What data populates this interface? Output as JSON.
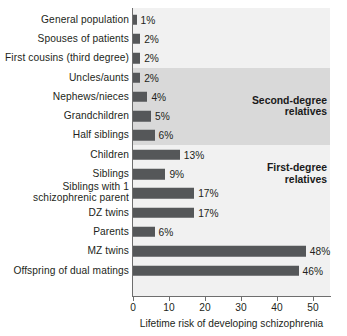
{
  "chart_data": {
    "type": "bar",
    "orientation": "horizontal",
    "title": "",
    "xlabel": "Lifetime risk of developing schizophrenia",
    "ylabel": "",
    "xlim": [
      0,
      55
    ],
    "xticks": [
      0,
      10,
      20,
      30,
      40,
      50
    ],
    "xtick_labels": [
      "0",
      "10",
      "20",
      "30",
      "40",
      "50"
    ],
    "value_suffix": "%",
    "grid": false,
    "legend": null,
    "categories": [
      "General population",
      "Spouses of patients",
      "First cousins (third degree)",
      "Uncles/aunts",
      "Nephews/nieces",
      "Grandchildren",
      "Half siblings",
      "Children",
      "Siblings",
      "Siblings with 1\nschizophrenic parent",
      "DZ twins",
      "Parents",
      "MZ twins",
      "Offspring of dual matings"
    ],
    "values": [
      1,
      2,
      2,
      2,
      4,
      5,
      6,
      13,
      9,
      17,
      17,
      6,
      48,
      46
    ],
    "value_labels": [
      "1%",
      "2%",
      "2%",
      "2%",
      "4%",
      "5%",
      "6%",
      "13%",
      "9%",
      "17%",
      "17%",
      "6%",
      "48%",
      "46%"
    ],
    "annotations": [
      {
        "text": "Second-degree\nrelatives",
        "start_category": "Uncles/aunts",
        "end_category": "Half siblings",
        "band_shade": "#d9d9d9"
      },
      {
        "text": "First-degree\nrelatives",
        "start_category": "Children",
        "end_category": "Siblings with 1\nschizophrenic parent",
        "band_shade": "#f1f1f1"
      }
    ],
    "colors": {
      "bar": "#555759",
      "plot_background": "#f1f1f1",
      "band_highlight": "#d9d9d9",
      "axis": "#6e6e6e",
      "text": "#231f20"
    }
  }
}
